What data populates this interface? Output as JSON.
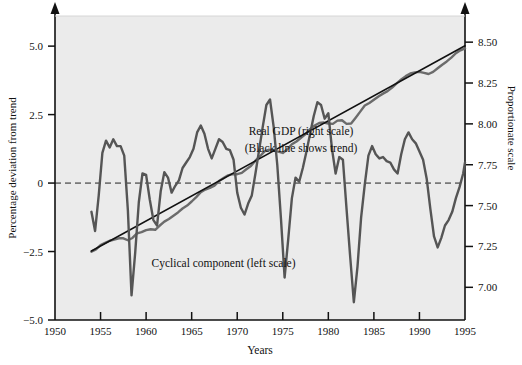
{
  "chart_data": {
    "type": "line",
    "title": "",
    "xlabel": "Years",
    "ylabel_left": "Percentage deviation from trend",
    "ylabel_right": "Proportionate scale",
    "grid": false,
    "legend_position": "inline-annotations",
    "xlim": [
      1950,
      1995
    ],
    "xticks": [
      1950,
      1955,
      1960,
      1965,
      1970,
      1975,
      1980,
      1985,
      1990,
      1995
    ],
    "xticklabels": [
      "1950",
      "1955",
      "1960",
      "1965",
      "1970",
      "1975",
      "1980",
      "1985",
      "1990",
      "1995"
    ],
    "ylim_left": [
      -5.0,
      6.1
    ],
    "yticks_left": [
      -5.0,
      -2.5,
      0,
      2.5,
      5.0
    ],
    "yticklabels_left": [
      "−5.0",
      "−2.5",
      "0",
      "2.5",
      "5.0"
    ],
    "ylim_right": [
      6.8,
      8.66
    ],
    "yticks_right": [
      7.0,
      7.25,
      7.5,
      7.75,
      8.0,
      8.25,
      8.5
    ],
    "yticklabels_right": [
      "7.00",
      "7.25",
      "7.50",
      "7.75",
      "8.00",
      "8.25",
      "8.50"
    ],
    "zero_reference_line": 0,
    "annotations": [
      {
        "name": "gdp-annotation-line1",
        "text": "Real GDP  (right scale)",
        "x": 1977.0,
        "y_right": 7.93
      },
      {
        "name": "gdp-annotation-line2",
        "text": "(Black line shows trend)",
        "x": 1977.0,
        "y_right": 7.83
      },
      {
        "name": "cyclical-annotation",
        "text": "Cyclical component (left scale)",
        "x": 1968.5,
        "y_left": -3.05
      }
    ],
    "series": [
      {
        "name": "Real GDP (right scale)",
        "axis": "right",
        "color": "#6b6b6b",
        "x": [
          1954.0,
          1954.5,
          1955.0,
          1955.5,
          1956.0,
          1956.5,
          1957.0,
          1957.5,
          1958.0,
          1958.5,
          1959.0,
          1959.5,
          1960.0,
          1960.5,
          1961.0,
          1961.5,
          1962.0,
          1962.5,
          1963.0,
          1963.5,
          1964.0,
          1964.5,
          1965.0,
          1965.5,
          1966.0,
          1966.5,
          1967.0,
          1967.5,
          1968.0,
          1968.5,
          1969.0,
          1969.5,
          1970.0,
          1970.5,
          1971.0,
          1971.5,
          1972.0,
          1972.5,
          1973.0,
          1973.5,
          1974.0,
          1974.5,
          1975.0,
          1975.5,
          1976.0,
          1976.5,
          1977.0,
          1977.5,
          1978.0,
          1978.5,
          1979.0,
          1979.5,
          1980.0,
          1980.5,
          1981.0,
          1981.5,
          1982.0,
          1982.5,
          1983.0,
          1983.5,
          1984.0,
          1984.5,
          1985.0,
          1985.5,
          1986.0,
          1986.5,
          1987.0,
          1987.5,
          1988.0,
          1988.5,
          1989.0,
          1989.5,
          1990.0,
          1990.5,
          1991.0,
          1991.5,
          1992.0,
          1992.5,
          1993.0,
          1993.5,
          1994.0,
          1994.5,
          1995.0
        ],
        "values": [
          7.218,
          7.232,
          7.258,
          7.272,
          7.285,
          7.292,
          7.3,
          7.3,
          7.288,
          7.302,
          7.33,
          7.338,
          7.35,
          7.355,
          7.352,
          7.378,
          7.402,
          7.418,
          7.438,
          7.458,
          7.482,
          7.5,
          7.525,
          7.552,
          7.582,
          7.598,
          7.608,
          7.622,
          7.65,
          7.668,
          7.685,
          7.692,
          7.692,
          7.7,
          7.722,
          7.742,
          7.775,
          7.802,
          7.832,
          7.842,
          7.838,
          7.83,
          7.822,
          7.845,
          7.875,
          7.892,
          7.915,
          7.938,
          7.968,
          7.99,
          8.005,
          8.008,
          8.002,
          8.0,
          8.02,
          8.022,
          8.0,
          8.002,
          8.038,
          8.075,
          8.112,
          8.128,
          8.148,
          8.168,
          8.185,
          8.2,
          8.222,
          8.248,
          8.272,
          8.292,
          8.308,
          8.315,
          8.318,
          8.312,
          8.305,
          8.318,
          8.34,
          8.362,
          8.382,
          8.405,
          8.432,
          8.45,
          8.462
        ]
      },
      {
        "name": "Trend (black line)",
        "axis": "right",
        "color": "#111111",
        "x": [
          1954.0,
          1995.0
        ],
        "values": [
          7.222,
          8.478
        ]
      },
      {
        "name": "Cyclical component (left scale)",
        "axis": "left",
        "color": "#555555",
        "x": [
          1954.0,
          1954.4,
          1954.8,
          1955.2,
          1955.6,
          1956.0,
          1956.4,
          1956.8,
          1957.2,
          1957.6,
          1958.0,
          1958.4,
          1958.8,
          1959.2,
          1959.6,
          1960.0,
          1960.4,
          1960.8,
          1961.2,
          1961.6,
          1962.0,
          1962.4,
          1962.8,
          1963.2,
          1963.6,
          1964.0,
          1964.4,
          1964.8,
          1965.2,
          1965.6,
          1966.0,
          1966.4,
          1966.8,
          1967.2,
          1967.6,
          1968.0,
          1968.4,
          1968.8,
          1969.2,
          1969.6,
          1970.0,
          1970.4,
          1970.8,
          1971.2,
          1971.6,
          1972.0,
          1972.4,
          1972.8,
          1973.2,
          1973.6,
          1974.0,
          1974.4,
          1974.8,
          1975.2,
          1975.6,
          1976.0,
          1976.4,
          1976.8,
          1977.2,
          1977.6,
          1978.0,
          1978.4,
          1978.8,
          1979.2,
          1979.6,
          1980.0,
          1980.4,
          1980.8,
          1981.2,
          1981.6,
          1982.0,
          1982.4,
          1982.8,
          1983.2,
          1983.6,
          1984.0,
          1984.4,
          1984.8,
          1985.2,
          1985.6,
          1986.0,
          1986.4,
          1986.8,
          1987.2,
          1987.6,
          1988.0,
          1988.4,
          1988.8,
          1989.2,
          1989.6,
          1990.0,
          1990.4,
          1990.8,
          1991.2,
          1991.6,
          1992.0,
          1992.4,
          1992.8,
          1993.2,
          1993.6,
          1994.0,
          1994.4,
          1994.8,
          1995.0
        ],
        "values": [
          -1.05,
          -1.75,
          -0.45,
          1.1,
          1.55,
          1.3,
          1.6,
          1.35,
          1.35,
          1.0,
          -1.0,
          -4.1,
          -2.55,
          -0.7,
          0.35,
          0.3,
          -0.6,
          -1.35,
          -1.55,
          -0.3,
          0.4,
          0.2,
          -0.35,
          -0.1,
          0.1,
          0.55,
          0.75,
          0.95,
          1.25,
          1.85,
          2.1,
          1.8,
          1.25,
          0.9,
          1.25,
          1.6,
          1.5,
          1.25,
          1.2,
          0.85,
          -0.35,
          -0.9,
          -1.15,
          -0.75,
          -0.45,
          0.35,
          1.2,
          2.05,
          2.85,
          3.05,
          2.05,
          0.65,
          -1.3,
          -3.45,
          -2.05,
          -0.55,
          0.2,
          0.05,
          0.55,
          1.15,
          1.8,
          2.45,
          2.95,
          2.85,
          2.35,
          2.55,
          1.25,
          0.35,
          0.95,
          0.85,
          -0.95,
          -2.7,
          -4.35,
          -3.05,
          -1.25,
          -0.05,
          1.0,
          1.35,
          1.05,
          0.9,
          0.95,
          0.8,
          0.75,
          0.5,
          0.35,
          1.05,
          1.6,
          1.85,
          1.6,
          1.45,
          1.15,
          0.85,
          0.15,
          -0.95,
          -1.95,
          -2.35,
          -2.0,
          -1.55,
          -1.35,
          -1.05,
          -0.55,
          -0.15,
          0.35,
          0.75
        ]
      }
    ]
  },
  "axis_labels": {
    "left_title": "Percentage deviation from trend",
    "right_title": "Proportionate scale",
    "x_title": "Years"
  }
}
